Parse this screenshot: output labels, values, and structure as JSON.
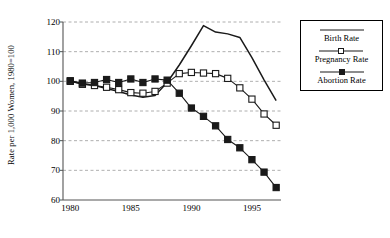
{
  "chart_data": {
    "type": "line",
    "title": "",
    "xlabel": "",
    "ylabel": "Rate per 1,000 Women, 1980=100",
    "xlim": [
      1979.4,
      1997.4
    ],
    "ylim": [
      60,
      120
    ],
    "yticks": [
      60,
      70,
      80,
      90,
      100,
      110,
      120
    ],
    "xticks": [
      1980,
      1985,
      1990,
      1995
    ],
    "grid": "horizontal-dashed",
    "legend_position": "right-outside",
    "x": [
      1980,
      1981,
      1982,
      1983,
      1984,
      1985,
      1986,
      1987,
      1988,
      1989,
      1990,
      1991,
      1992,
      1993,
      1994,
      1995,
      1996,
      1997
    ],
    "series": [
      {
        "name": "Birth Rate",
        "marker": "none",
        "values": [
          100.0,
          99.2,
          98.6,
          97.6,
          96.6,
          95.4,
          94.6,
          95.2,
          99.6,
          105.5,
          112.0,
          118.8,
          116.6,
          116.0,
          114.8,
          108.0,
          100.5,
          93.5
        ]
      },
      {
        "name": "Pregnancy Rate",
        "marker": "open-square",
        "values": [
          100.0,
          99.0,
          98.6,
          98.0,
          97.2,
          96.2,
          96.0,
          96.6,
          99.4,
          102.6,
          103.0,
          102.8,
          102.6,
          101.0,
          97.8,
          94.0,
          89.0,
          85.2
        ]
      },
      {
        "name": "Abortion Rate",
        "marker": "filled-square",
        "values": [
          100.2,
          99.4,
          99.6,
          100.6,
          99.6,
          100.8,
          99.6,
          100.8,
          100.4,
          96.0,
          91.0,
          88.2,
          85.0,
          80.4,
          77.6,
          73.6,
          69.4,
          64.2
        ]
      }
    ]
  },
  "legend": {
    "items": [
      {
        "label": "Birth Rate",
        "marker": "none"
      },
      {
        "label": "Pregnancy Rate",
        "marker": "open-square"
      },
      {
        "label": "Abortion Rate",
        "marker": "filled-square"
      }
    ]
  },
  "colors": {
    "line": "#1a1a1a",
    "grid": "#9a9a9a",
    "axis": "#555555",
    "background": "#ffffff"
  }
}
